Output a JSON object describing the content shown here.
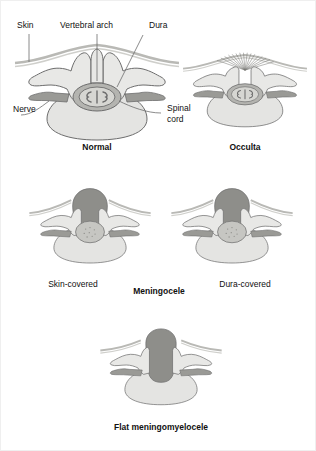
{
  "figure": {
    "background_color": "#ffffff",
    "frame_color": "#efefef"
  },
  "palette": {
    "outline": "#6d6d6d",
    "bone_fill": "#e8e8e6",
    "vertebral_body_fill": "#e4e4e2",
    "nerve_fill": "#9a9a96",
    "dura_fill": "#b4b4b0",
    "cord_fill": "#d6d6d2",
    "sac_dark_fill": "#8e8e8a",
    "skin_line": "#b9b9b5",
    "hair_tuft": "#7a7a76",
    "text": "#111111"
  },
  "labels": {
    "skin": "Skin",
    "vertebral_arch": "Vertebral arch",
    "dura": "Dura",
    "nerve": "Nerve",
    "spinal_cord_line1": "Spinal",
    "spinal_cord_line2": "cord"
  },
  "panels": [
    {
      "id": "normal",
      "caption": "Normal",
      "caption_bold": true,
      "row": 1,
      "column": "left",
      "has_hair_tuft": false,
      "has_sac": false,
      "arch_closed": true,
      "description": "Intact vertebral arch with spinous process; spinal cord within dura"
    },
    {
      "id": "occulta",
      "caption": "Occulta",
      "caption_bold": true,
      "row": 1,
      "column": "right",
      "has_hair_tuft": true,
      "has_sac": false,
      "arch_closed": false,
      "description": "Vertebral arch defect hidden under skin with overlying hair tuft"
    },
    {
      "id": "meningocele-skin-covered",
      "caption": "Skin-covered",
      "caption_bold": false,
      "row": 2,
      "column": "left",
      "has_hair_tuft": false,
      "has_sac": true,
      "arch_closed": false,
      "description": "Meningeal sac protruding through arch defect, covered by skin"
    },
    {
      "id": "meningocele-dura-covered",
      "caption": "Dura-covered",
      "caption_bold": false,
      "row": 2,
      "column": "right",
      "has_hair_tuft": false,
      "has_sac": true,
      "arch_closed": false,
      "description": "Meningeal sac protruding through arch defect, covered by dura only"
    },
    {
      "id": "flat-meningomyelocele",
      "caption": "Flat meningomyelocele",
      "caption_bold": true,
      "row": 3,
      "column": "center",
      "has_hair_tuft": false,
      "has_sac": true,
      "arch_closed": false,
      "description": "Neural tissue exposed in a flat plaque at the skin surface"
    }
  ],
  "group_caption": {
    "meningocele": "Meningocele"
  }
}
